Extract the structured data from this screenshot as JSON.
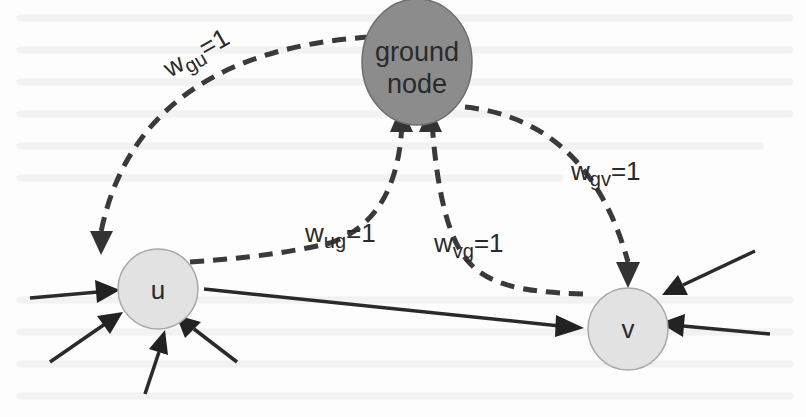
{
  "diagram": {
    "nodes": {
      "ground": {
        "line1": "ground",
        "line2": "node",
        "fill": "#8c8c8c"
      },
      "u": {
        "label": "u",
        "fill": "#e2e2e2"
      },
      "v": {
        "label": "v",
        "fill": "#e2e2e2"
      }
    },
    "edge_labels": {
      "gu": {
        "base": "w",
        "sub": "gu",
        "value": "=1"
      },
      "ug": {
        "base": "w",
        "sub": "ug",
        "value": "=1"
      },
      "vg": {
        "base": "w",
        "sub": "vg",
        "value": "=1"
      },
      "gv": {
        "base": "w",
        "sub": "gv",
        "value": "=1"
      }
    },
    "colors": {
      "edge": "#2a2a2a",
      "ground_node": "#8c8c8c",
      "node": "#e2e2e2",
      "node_stroke": "#a8a8a8"
    }
  }
}
